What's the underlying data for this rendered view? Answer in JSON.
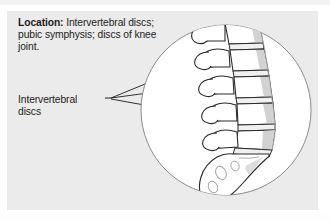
{
  "figure": {
    "panel_background": "#ebebeb",
    "circle_fill": "#ffffff",
    "circle_stroke": "#8a8a8a",
    "line_color": "#1c1c1c",
    "bone_fill": "#ffffff",
    "bone_shade": "#cfcfcf",
    "text_color": "#1c1c1c"
  },
  "location": {
    "label": "Location:",
    "text": " Intervertebral discs; pubic symphysis; discs of knee joint."
  },
  "callout": {
    "line1": "Intervertebral",
    "line2": "discs"
  },
  "illustration": {
    "name": "lumbar-spine-sagittal-view",
    "parts": [
      "lumbar-vertebrae",
      "intervertebral-discs",
      "sacrum",
      "coccyx"
    ]
  }
}
